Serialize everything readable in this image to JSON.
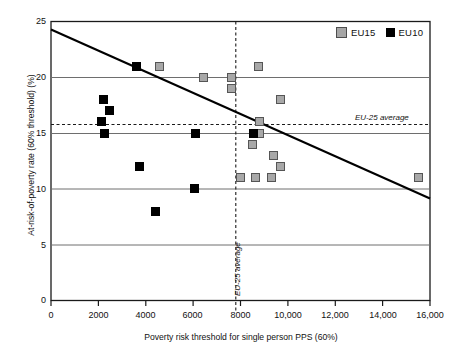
{
  "chart_data": {
    "type": "scatter",
    "title": "",
    "xlabel": "Poverty risk threshold for single person PPS (60%)",
    "ylabel": "At-risk-of-poverty rate (60% threshold) (%)",
    "xlim": [
      0,
      16000
    ],
    "ylim": [
      0,
      25
    ],
    "grid": "horizontal-gridlines-at-y-ticks",
    "legend_position": "top-right",
    "xticks": [
      0,
      2000,
      4000,
      6000,
      8000,
      10000,
      12000,
      14000,
      16000
    ],
    "xticklabels": [
      "0",
      "2000",
      "4000",
      "6000",
      "8000",
      "10,000",
      "12,000",
      "14,000",
      "16,000"
    ],
    "yticks": [
      0,
      5,
      10,
      15,
      20,
      25
    ],
    "yticklabels": [
      "0",
      "5",
      "10",
      "15",
      "20",
      "25"
    ],
    "series": [
      {
        "name": "EU15",
        "color": "#a8a8a8",
        "marker": "square",
        "points": [
          {
            "x": 8750,
            "y": 21.0
          },
          {
            "x": 4600,
            "y": 21.0
          },
          {
            "x": 6450,
            "y": 20.0
          },
          {
            "x": 7600,
            "y": 20.0
          },
          {
            "x": 7600,
            "y": 19.0
          },
          {
            "x": 9700,
            "y": 18.0
          },
          {
            "x": 8800,
            "y": 16.0
          },
          {
            "x": 8800,
            "y": 15.0
          },
          {
            "x": 8500,
            "y": 14.0
          },
          {
            "x": 9400,
            "y": 13.0
          },
          {
            "x": 9700,
            "y": 12.0
          },
          {
            "x": 8000,
            "y": 11.0
          },
          {
            "x": 8650,
            "y": 11.0
          },
          {
            "x": 9300,
            "y": 11.0
          },
          {
            "x": 15500,
            "y": 11.0
          }
        ]
      },
      {
        "name": "EU10",
        "color": "#000000",
        "marker": "square",
        "points": [
          {
            "x": 3600,
            "y": 21.0
          },
          {
            "x": 2200,
            "y": 18.0
          },
          {
            "x": 2450,
            "y": 17.0
          },
          {
            "x": 2150,
            "y": 16.0
          },
          {
            "x": 2250,
            "y": 15.0
          },
          {
            "x": 6100,
            "y": 15.0
          },
          {
            "x": 8550,
            "y": 15.0
          },
          {
            "x": 3750,
            "y": 12.0
          },
          {
            "x": 6050,
            "y": 10.0
          },
          {
            "x": 4400,
            "y": 8.0
          }
        ]
      }
    ],
    "trendline": {
      "label": "linear trend",
      "x_start": 0,
      "y_start": 24.3,
      "x_end": 16000,
      "y_end": 9.1
    },
    "reference_lines": [
      {
        "orientation": "horizontal",
        "label": "EU-25 average",
        "value": 15.8,
        "style": "dashed"
      },
      {
        "orientation": "vertical",
        "label": "EU-25 average",
        "value": 7800,
        "style": "dashed"
      }
    ]
  },
  "legend": {
    "entries": [
      {
        "label": "EU15",
        "swatch": "gray-square-icon"
      },
      {
        "label": "EU10",
        "swatch": "black-square-icon"
      }
    ]
  },
  "annotations": {
    "horizontal_reference_label": "EU-25 average",
    "vertical_reference_label": "EU-25 average"
  }
}
